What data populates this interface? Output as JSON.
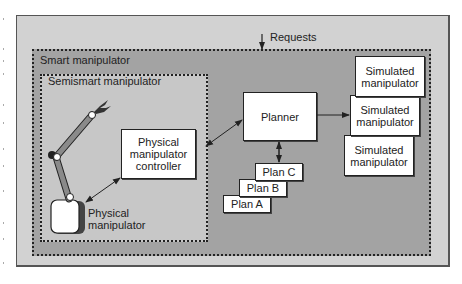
{
  "diagram": {
    "requests_label": "Requests",
    "smart_manipulator_label": "Smart manipulator",
    "semismart_manipulator_label": "Semismart manipulator",
    "physical_controller_label": "Physical\nmanipulator\ncontroller",
    "physical_manipulator_label": "Physical\nmanipulator",
    "planner_label": "Planner",
    "plans": [
      "Plan C",
      "Plan B",
      "Plan A"
    ],
    "simulated_manipulators": [
      "Simulated\nmanipulator",
      "Simulated\nmanipulator",
      "Simulated\nmanipulator"
    ],
    "colors": {
      "outer_fill": "#d2d2d2",
      "smart_fill": "#a3a3a3",
      "semismart_fill": "#c7c7c7",
      "box_fill": "#ffffff",
      "line": "#222222"
    }
  }
}
